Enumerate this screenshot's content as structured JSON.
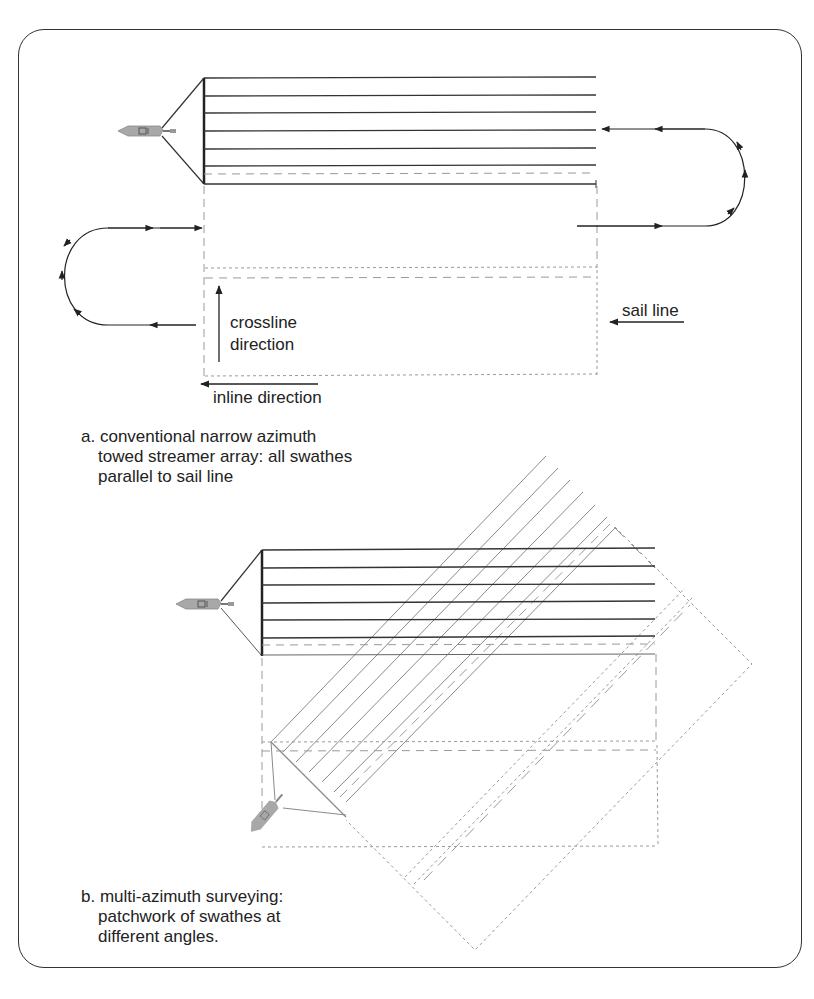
{
  "colors": {
    "frame": "#333333",
    "streamer": "#333333",
    "streamer_rotated": "#8a8a8a",
    "dashed": "#9a9a9a",
    "vessel": "#a8a8a8",
    "text": "#222222"
  },
  "panel_a": {
    "labels": {
      "crossline": [
        "crossline",
        "direction"
      ],
      "inline": "inline direction",
      "sail_line": "sail line"
    },
    "caption": {
      "marker": "a.",
      "lines": [
        "conventional narrow azimuth",
        "towed streamer array: all swathes",
        "parallel to sail line"
      ]
    },
    "streamer_count": 6,
    "icons": [
      "vessel-icon",
      "turn-loop-right",
      "turn-loop-left",
      "crossline-arrow",
      "inline-arrow",
      "sail-line-arrow"
    ]
  },
  "panel_b": {
    "caption": {
      "marker": "b.",
      "lines": [
        "multi-azimuth surveying:",
        "patchwork of swathes at",
        "different angles."
      ]
    },
    "streamer_count": 6,
    "rotated_angle_deg": 40,
    "icons": [
      "vessel-icon",
      "rotated-vessel-icon"
    ]
  }
}
